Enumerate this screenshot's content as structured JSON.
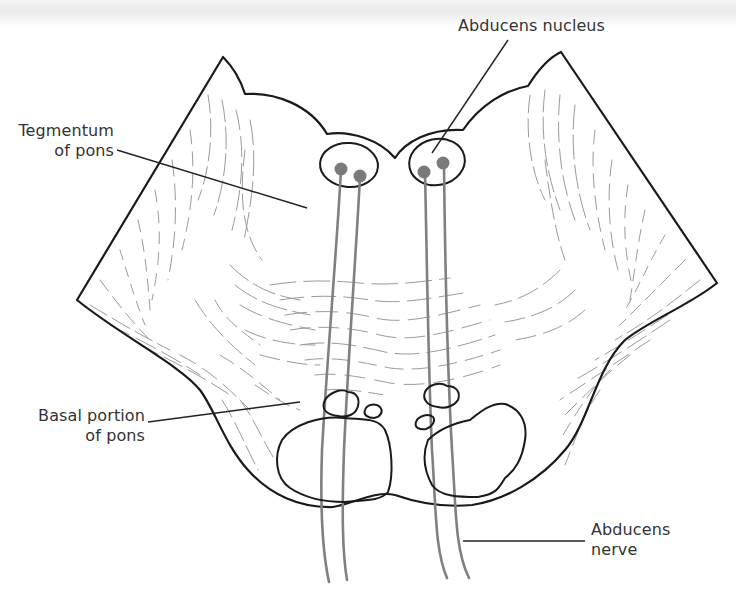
{
  "figure": {
    "colors": {
      "outline": "#1a1a1a",
      "fibers": "#8a8a8a",
      "nerve": "#808080",
      "nucleus_dot": "#7a7a7a",
      "leader_line": "#222222",
      "label_text": "#333333"
    }
  },
  "labels": {
    "abducens_nucleus": {
      "line1": "Abducens nucleus"
    },
    "tegmentum": {
      "line1": "Tegmentum",
      "line2": "of pons"
    },
    "basal_portion": {
      "line1": "Basal portion",
      "line2": "of pons"
    },
    "abducens_nerve": {
      "line1": "Abducens",
      "line2": "nerve"
    }
  }
}
